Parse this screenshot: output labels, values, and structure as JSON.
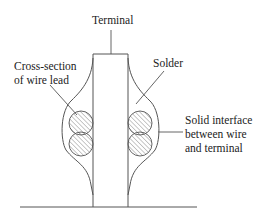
{
  "diagram": {
    "labels": {
      "terminal": "Terminal",
      "cross_section": [
        "Cross-section",
        "of wire lead"
      ],
      "solder": "Solder",
      "interface": [
        "Solid interface",
        "between wire",
        "and terminal"
      ]
    },
    "colors": {
      "stroke": "#555555",
      "text": "#222222",
      "hatch": "#777777",
      "background": "#ffffff"
    }
  }
}
